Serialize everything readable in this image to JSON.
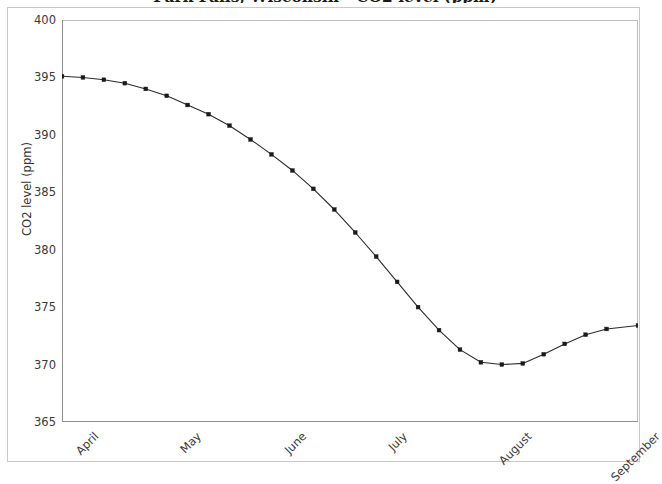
{
  "chart_data": {
    "type": "line",
    "title": "Park Falls, Wisconsin - CO2 level (ppm)",
    "xlabel": "",
    "ylabel": "CO2 level (ppm)",
    "ylim": [
      365,
      400
    ],
    "yticks": [
      365,
      370,
      375,
      380,
      385,
      390,
      395,
      400
    ],
    "ytick_labels": [
      "365",
      "370",
      "375",
      "380",
      "385",
      "390",
      "395",
      "400"
    ],
    "xtick_labels": [
      "April",
      "May",
      "June",
      "July",
      "August",
      "September"
    ],
    "xtick_positions": [
      0,
      5,
      10,
      15,
      20,
      25
    ],
    "xlim": [
      0,
      27.5
    ],
    "grid": false,
    "legend": null,
    "marker": "square",
    "line_color": "#2b2b2b",
    "marker_color": "#1a1a1a",
    "axis_color": "#8f8f8f",
    "frame_color": "#c9c9c9",
    "background": "#ffffff",
    "series": [
      {
        "name": "CO2 level",
        "x": [
          0,
          1,
          2,
          3,
          4,
          5,
          6,
          7,
          8,
          9,
          10,
          11,
          12,
          13,
          14,
          15,
          16,
          17,
          18,
          19,
          20,
          21,
          22,
          23,
          24,
          25,
          26,
          27.5
        ],
        "values": [
          395.1,
          395.0,
          394.8,
          394.5,
          394.0,
          393.4,
          392.6,
          391.8,
          390.8,
          389.6,
          388.3,
          386.9,
          385.3,
          383.5,
          381.5,
          379.4,
          377.2,
          375.0,
          373.0,
          371.3,
          370.2,
          370.0,
          370.1,
          370.9,
          371.8,
          372.6,
          373.1,
          373.4
        ]
      }
    ]
  }
}
